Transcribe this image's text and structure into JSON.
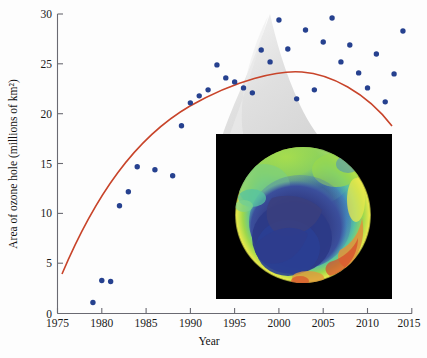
{
  "figure": {
    "background_color": "#fdfdfd",
    "dot_color": "#26418f",
    "curve_color": "#c8442a",
    "axis_color": "#6a6a72",
    "plume_color": "#d9d9d9"
  },
  "axes": {
    "x_title": "Year",
    "y_title": "Area of ozone hole (millions of km²)",
    "x_ticks": [
      "1975",
      "1980",
      "1985",
      "1990",
      "1995",
      "2000",
      "2005",
      "2010",
      "2015"
    ],
    "y_ticks": [
      "0",
      "5",
      "10",
      "15",
      "20",
      "25",
      "30"
    ]
  },
  "inset": {
    "name": "ozone-hole-satellite-image",
    "description": "Satellite false-color map of the Antarctic ozone hole",
    "colors": [
      "#000000",
      "#2b3f8c",
      "#3f6fbf",
      "#4fb3a8",
      "#8fd44a",
      "#e8e84a",
      "#e8903a",
      "#d8452a"
    ]
  },
  "chart_data": {
    "type": "scatter",
    "title": "",
    "xlabel": "Year",
    "ylabel": "Area of ozone hole (millions of km²)",
    "xlim": [
      1975,
      2015
    ],
    "ylim": [
      0,
      30
    ],
    "grid": false,
    "legend": null,
    "annotations": [
      "grey ozone-plume silhouette behind data",
      "inset satellite image of Antarctic ozone hole"
    ],
    "series": [
      {
        "name": "Area of ozone hole",
        "type": "scatter",
        "marker": "circle",
        "color": "#26418f",
        "x": [
          1979,
          1980,
          1981,
          1982,
          1983,
          1984,
          1986,
          1988,
          1989,
          1990,
          1991,
          1992,
          1993,
          1994,
          1995,
          1996,
          1997,
          1998,
          1999,
          2000,
          2001,
          2002,
          2003,
          2004,
          2005,
          2006,
          2007,
          2008,
          2009,
          2010,
          2011,
          2012,
          2013,
          2014
        ],
        "y": [
          1.1,
          3.3,
          3.2,
          10.8,
          12.2,
          14.7,
          14.4,
          13.8,
          18.8,
          21.1,
          21.8,
          22.4,
          24.9,
          23.6,
          23.2,
          22.6,
          22.1,
          26.4,
          25.2,
          29.4,
          26.5,
          21.5,
          28.4,
          22.4,
          27.2,
          29.6,
          25.2,
          26.9,
          24.1,
          22.6,
          26.0,
          21.2,
          24.0,
          28.3
        ]
      },
      {
        "name": "Quadratic trend",
        "type": "line",
        "color": "#c8442a",
        "x": [
          1979.2,
          1981,
          1983,
          1985,
          1987,
          1989,
          1991,
          1993,
          1995,
          1997,
          1999,
          2001,
          2003,
          2005,
          2007,
          2009,
          2011,
          2013,
          2014.6
        ],
        "y": [
          3.9,
          8.0,
          12.0,
          15.4,
          18.3,
          20.7,
          22.6,
          24.1,
          25.4,
          26.4,
          27.1,
          27.5,
          27.5,
          27.2,
          26.6,
          25.7,
          24.5,
          23.1,
          21.8
        ]
      }
    ]
  }
}
